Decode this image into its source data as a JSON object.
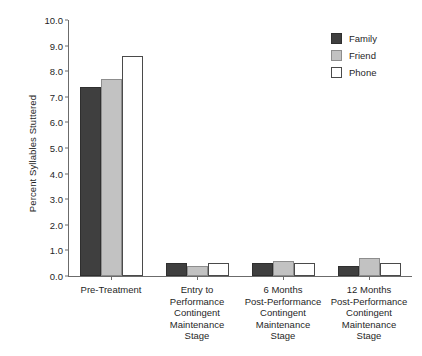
{
  "chart_data": {
    "type": "bar",
    "title": "",
    "xlabel": "",
    "ylabel": "Percent Syllables Stuttered",
    "ylim": [
      0.0,
      10.0
    ],
    "ytick_step": 1.0,
    "ytick_labels": [
      "10.0",
      "9.0",
      "8.0",
      "7.0",
      "6.0",
      "5.0",
      "4.0",
      "3.0",
      "2.0",
      "1.0",
      "0.0"
    ],
    "ytick_values": [
      10.0,
      9.0,
      8.0,
      7.0,
      6.0,
      5.0,
      4.0,
      3.0,
      2.0,
      1.0,
      0.0
    ],
    "grid": false,
    "legend_position": "top-right",
    "categories": [
      "Pre-Treatment",
      "Entry to Performance Contingent Maintenance Stage",
      "6 Months Post-Performance Contingent Maintenance Stage",
      "12 Months Post-Performance Contingent Maintenance Stage"
    ],
    "category_lines": [
      [
        "Pre-Treatment"
      ],
      [
        "Entry to",
        "Performance",
        "Contingent",
        "Maintenance",
        "Stage"
      ],
      [
        "6 Months",
        "Post-Performance",
        "Contingent",
        "Maintenance",
        "Stage"
      ],
      [
        "12 Months",
        "Post-Performance",
        "Contingent",
        "Maintenance",
        "Stage"
      ]
    ],
    "series": [
      {
        "name": "Family",
        "color": "#3f3f3f",
        "values": [
          7.4,
          0.5,
          0.5,
          0.4
        ]
      },
      {
        "name": "Friend",
        "color": "#c2c2c2",
        "values": [
          7.7,
          0.4,
          0.6,
          0.7
        ]
      },
      {
        "name": "Phone",
        "color": "#ffffff",
        "values": [
          8.6,
          0.5,
          0.5,
          0.5
        ]
      }
    ]
  },
  "legend": {
    "items": [
      {
        "label": "Family",
        "swatch": "family"
      },
      {
        "label": "Friend",
        "swatch": "friend"
      },
      {
        "label": "Phone",
        "swatch": "phone"
      }
    ]
  },
  "colors": {
    "family": "#3f3f3f",
    "friend": "#c2c2c2",
    "phone": "#ffffff",
    "axis": "#6b6b6b",
    "text": "#1f1f1f",
    "background": "#ffffff"
  }
}
